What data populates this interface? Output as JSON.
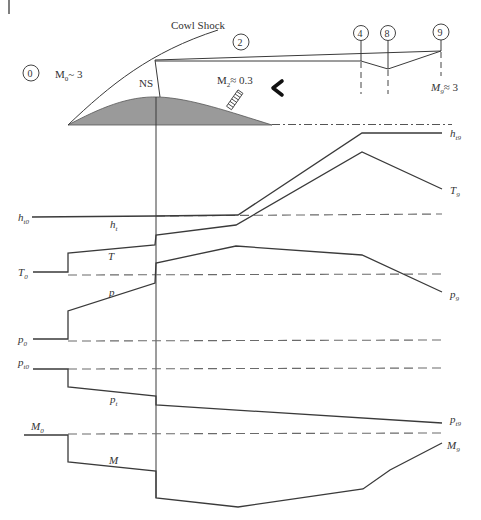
{
  "diagram": {
    "type": "inlet-flow-property-distribution",
    "colors": {
      "line": "#3a3a3a",
      "reference_dash": "#6a6a6a",
      "centerbody_fill": "#9a9a9a",
      "text": "#333333",
      "background": "#ffffff"
    },
    "inlet_sketch": {
      "cowl_shock_label": "Cowl Shock",
      "normal_shock_label": "NS",
      "freestream_mach_label": "M",
      "freestream_mach_sub": "0",
      "freestream_mach_value": "~ 3",
      "throat_mach_label": "M",
      "throat_mach_sub": "2",
      "throat_mach_value": "≈ 0.3",
      "exit_mach_label": "M",
      "exit_mach_sub": "9",
      "exit_mach_value": "≈ 3",
      "flow_direction_glyph": "‹",
      "stations": [
        {
          "id": "0",
          "label": "0"
        },
        {
          "id": "2",
          "label": "2"
        },
        {
          "id": "4",
          "label": "4"
        },
        {
          "id": "8",
          "label": "8"
        },
        {
          "id": "9",
          "label": "9"
        }
      ]
    },
    "property_traces": [
      {
        "name": "ht",
        "left_label": "h",
        "left_sub": "t0",
        "mid_label": "h",
        "mid_sub": "t",
        "right_label": "h",
        "right_sub": "t9"
      },
      {
        "name": "T",
        "left_label": "T",
        "left_sub": "0",
        "mid_label": "T",
        "mid_sub": "",
        "right_label": "T",
        "right_sub": "9"
      },
      {
        "name": "p",
        "left_label": "p",
        "left_sub": "0",
        "mid_label": "p",
        "mid_sub": "",
        "right_label": "p",
        "right_sub": "9"
      },
      {
        "name": "pt",
        "left_label": "p",
        "left_sub": "t0",
        "mid_label": "p",
        "mid_sub": "t",
        "right_label": "p",
        "right_sub": "t9"
      },
      {
        "name": "M",
        "left_label": "M",
        "left_sub": "0",
        "mid_label": "M",
        "mid_sub": "",
        "right_label": "M",
        "right_sub": "9"
      }
    ]
  }
}
